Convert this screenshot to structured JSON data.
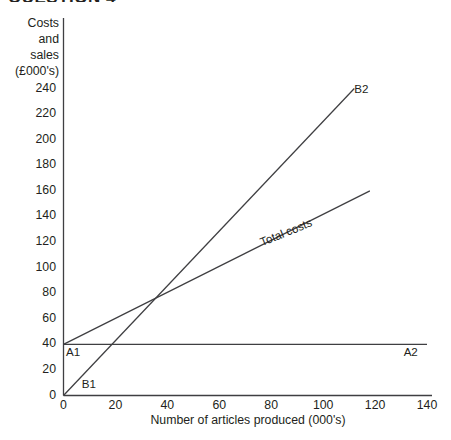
{
  "page": {
    "cropped_heading": "QUESTION 4"
  },
  "chart_data": {
    "type": "line",
    "title": "",
    "xlabel": "Number of articles produced (000's)",
    "ylabel": "Costs\nand\nsales\n(£000's)",
    "ylabel_lines": [
      "Costs",
      "and",
      "sales",
      "(£000's)"
    ],
    "xlim": [
      0,
      140
    ],
    "ylim": [
      0,
      250
    ],
    "xticks": [
      0,
      20,
      40,
      60,
      80,
      100,
      120,
      140
    ],
    "yticks": [
      0,
      20,
      40,
      60,
      80,
      100,
      120,
      140,
      160,
      180,
      200,
      220,
      240
    ],
    "xtick_labels": [
      "0",
      "20",
      "40",
      "60",
      "80",
      "100",
      "120",
      "140"
    ],
    "ytick_labels": [
      "0",
      "20",
      "40",
      "60",
      "80",
      "100",
      "120",
      "140",
      "160",
      "180",
      "200",
      "220",
      "240"
    ],
    "grid": false,
    "legend_position": "inline-annotations",
    "line_color": "#3f3f42",
    "series": [
      {
        "name": "Total costs",
        "label": "Total costs",
        "start_point": {
          "x": 0,
          "y": 40
        },
        "end_point": {
          "x": 118,
          "y": 160
        },
        "points": [
          [
            0,
            40
          ],
          [
            118,
            160
          ]
        ]
      },
      {
        "name": "Sales",
        "label": "",
        "start_label": "B1",
        "end_label": "B2",
        "start_point": {
          "x": 0,
          "y": 0
        },
        "end_point": {
          "x": 112,
          "y": 240
        },
        "points": [
          [
            0,
            0
          ],
          [
            112,
            240
          ]
        ]
      },
      {
        "name": "Fixed costs",
        "label": "",
        "start_label": "A1",
        "end_label": "A2",
        "start_point": {
          "x": 0,
          "y": 40
        },
        "end_point": {
          "x": 140,
          "y": 40
        },
        "points": [
          [
            0,
            40
          ],
          [
            140,
            40
          ]
        ]
      }
    ],
    "annotations": [
      {
        "text": "B2",
        "x": 112,
        "y": 240,
        "name": "label-b2"
      },
      {
        "text": "Total costs",
        "x": 75,
        "y": 125,
        "name": "label-total-costs",
        "rotation": -22
      },
      {
        "text": "A1",
        "x": 1,
        "y": 34,
        "name": "label-a1"
      },
      {
        "text": "A2",
        "x": 131,
        "y": 34,
        "name": "label-a2"
      },
      {
        "text": "B1",
        "x": 7,
        "y": 9,
        "name": "label-b1"
      }
    ],
    "breakeven_point": {
      "x": 50,
      "y": 100
    }
  }
}
